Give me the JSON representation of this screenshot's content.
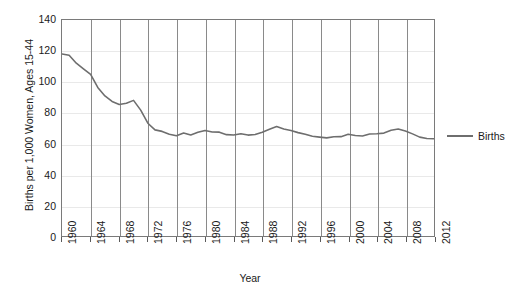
{
  "chart_data": {
    "type": "line",
    "title": "",
    "xlabel": "Year",
    "ylabel": "Births per 1,000 Women, Ages 15-44",
    "xlim": [
      1960,
      2012
    ],
    "ylim": [
      0,
      140
    ],
    "y_ticks": [
      0,
      20,
      40,
      60,
      80,
      100,
      120,
      140
    ],
    "x_ticks": [
      1960,
      1964,
      1968,
      1972,
      1976,
      1980,
      1984,
      1988,
      1992,
      1996,
      2000,
      2004,
      2008,
      2012
    ],
    "grid": "horizontal-light-and-vertical-gray",
    "legend_position": "right",
    "series": [
      {
        "name": "Births",
        "color": "#6e6e6e",
        "x": [
          1960,
          1961,
          1962,
          1963,
          1964,
          1965,
          1966,
          1967,
          1968,
          1969,
          1970,
          1971,
          1972,
          1973,
          1974,
          1975,
          1976,
          1977,
          1978,
          1979,
          1980,
          1981,
          1982,
          1983,
          1984,
          1985,
          1986,
          1987,
          1988,
          1989,
          1990,
          1991,
          1992,
          1993,
          1994,
          1995,
          1996,
          1997,
          1998,
          1999,
          2000,
          2001,
          2002,
          2003,
          2004,
          2005,
          2006,
          2007,
          2008,
          2009,
          2010,
          2011,
          2012
        ],
        "values": [
          118.0,
          117.1,
          112.0,
          108.3,
          104.7,
          96.3,
          90.8,
          87.2,
          85.2,
          86.1,
          87.9,
          81.6,
          73.1,
          68.8,
          67.8,
          66.0,
          65.0,
          66.8,
          65.5,
          67.2,
          68.4,
          67.4,
          67.3,
          65.7,
          65.5,
          66.3,
          65.4,
          65.8,
          67.3,
          69.2,
          70.9,
          69.3,
          68.4,
          67.0,
          65.9,
          64.6,
          64.1,
          63.6,
          64.3,
          64.4,
          65.9,
          65.1,
          64.8,
          66.1,
          66.3,
          66.7,
          68.5,
          69.3,
          68.1,
          66.2,
          64.1,
          63.2,
          63.0
        ]
      }
    ]
  },
  "legend": {
    "items": [
      {
        "label": "Births",
        "color": "#6e6e6e"
      }
    ]
  },
  "axes": {
    "y_title": "Births per 1,000 Women, Ages 15-44",
    "x_title": "Year",
    "y_tick_labels": [
      "140",
      "120",
      "100",
      "80",
      "60",
      "40",
      "20",
      "0"
    ],
    "x_tick_labels": [
      "1960",
      "1964",
      "1968",
      "1972",
      "1976",
      "1980",
      "1984",
      "1988",
      "1992",
      "1996",
      "2000",
      "2004",
      "2008",
      "2012"
    ]
  },
  "caption": {
    "text": ""
  }
}
